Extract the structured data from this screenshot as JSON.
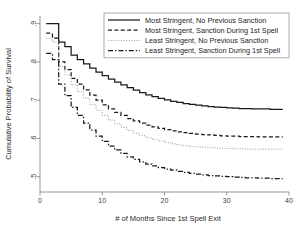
{
  "chart_data": {
    "type": "line",
    "title": "",
    "xlabel": "# of Months Since 1st Spell Exit",
    "ylabel": "Cumulative Probability of Survival",
    "xlim": [
      0,
      40
    ],
    "ylim": [
      0.46,
      0.92
    ],
    "xticks": [
      0,
      10,
      20,
      30,
      40
    ],
    "xticklabels": [
      "0",
      "10",
      "20",
      "30",
      "40"
    ],
    "yticks": [
      0.5,
      0.6,
      0.7,
      0.8,
      0.9
    ],
    "yticklabels": [
      ".5",
      ".6",
      ".7",
      ".8",
      ".9"
    ],
    "grid": false,
    "legend_position": "top-right",
    "step": true,
    "x": [
      1,
      2,
      3,
      4,
      5,
      6,
      7,
      8,
      9,
      10,
      11,
      12,
      13,
      14,
      15,
      16,
      17,
      18,
      19,
      20,
      21,
      22,
      23,
      24,
      25,
      26,
      27,
      28,
      29,
      30,
      31,
      32,
      33,
      34,
      35,
      36,
      37,
      38,
      39
    ],
    "series": [
      {
        "name": "Most Stringent, No Previous Sanction",
        "linestyle": "solid",
        "color": "#1a1a1a",
        "values": [
          0.9,
          0.9,
          0.852,
          0.84,
          0.818,
          0.806,
          0.795,
          0.784,
          0.773,
          0.764,
          0.755,
          0.747,
          0.74,
          0.733,
          0.726,
          0.72,
          0.714,
          0.709,
          0.705,
          0.701,
          0.697,
          0.694,
          0.691,
          0.689,
          0.687,
          0.685,
          0.683,
          0.682,
          0.681,
          0.68,
          0.679,
          0.678,
          0.678,
          0.677,
          0.677,
          0.677,
          0.676,
          0.676,
          0.676
        ]
      },
      {
        "name": "Most Stringent, Sanction During 1st Spell",
        "linestyle": "dashed",
        "color": "#1a1a1a",
        "values": [
          0.875,
          0.862,
          0.8,
          0.78,
          0.757,
          0.742,
          0.727,
          0.713,
          0.7,
          0.688,
          0.677,
          0.668,
          0.66,
          0.652,
          0.646,
          0.64,
          0.635,
          0.63,
          0.626,
          0.623,
          0.62,
          0.617,
          0.615,
          0.613,
          0.611,
          0.61,
          0.609,
          0.608,
          0.607,
          0.606,
          0.606,
          0.605,
          0.605,
          0.605,
          0.604,
          0.604,
          0.604,
          0.604,
          0.604
        ]
      },
      {
        "name": "Least Stringent, No Previous Sanction",
        "linestyle": "dotted",
        "color": "#9a9a9a",
        "values": [
          0.862,
          0.852,
          0.788,
          0.766,
          0.74,
          0.722,
          0.705,
          0.689,
          0.674,
          0.66,
          0.648,
          0.638,
          0.629,
          0.621,
          0.614,
          0.608,
          0.602,
          0.597,
          0.593,
          0.589,
          0.586,
          0.583,
          0.581,
          0.579,
          0.578,
          0.577,
          0.576,
          0.575,
          0.574,
          0.574,
          0.573,
          0.573,
          0.572,
          0.572,
          0.572,
          0.572,
          0.572,
          0.572,
          0.572
        ]
      },
      {
        "name": "Least Stringent, Sanction During 1st Spell",
        "linestyle": "dashdot",
        "color": "#1a1a1a",
        "values": [
          0.822,
          0.806,
          0.742,
          0.712,
          0.681,
          0.66,
          0.64,
          0.622,
          0.606,
          0.592,
          0.58,
          0.57,
          0.561,
          0.552,
          0.545,
          0.539,
          0.533,
          0.528,
          0.524,
          0.52,
          0.517,
          0.514,
          0.511,
          0.509,
          0.507,
          0.505,
          0.503,
          0.502,
          0.501,
          0.5,
          0.499,
          0.498,
          0.497,
          0.497,
          0.496,
          0.496,
          0.495,
          0.495,
          0.495
        ]
      }
    ]
  }
}
